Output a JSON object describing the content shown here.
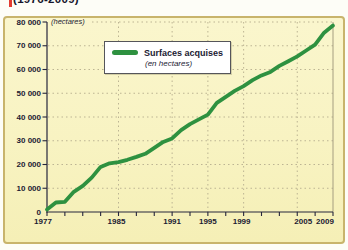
{
  "page": {
    "clipped_title": "(1976-2009)"
  },
  "legend": {
    "label": "Surfaces acquises",
    "sublabel": "(en hectares)"
  },
  "axes": {
    "y_unit_label": "(hectares)",
    "y_tick_labels": [
      "80 000",
      "70 000",
      "60 000",
      "50 000",
      "40 000",
      "30 000",
      "20 000",
      "10 000",
      "0"
    ],
    "x_tick_labels": [
      "1977",
      "1985",
      "1991",
      "1995",
      "1999",
      "2005",
      "2009"
    ]
  },
  "colors": {
    "line_green": "#2E9140",
    "panel_bg": "#F8F3C2",
    "panel_border": "#C8B46C",
    "grid": "#BCB493",
    "plot_right_frame": "#A59E80",
    "axis": "#26263C",
    "text": "#1B1B33",
    "legend_border": "#55555A",
    "red_mark": "#E23B31"
  },
  "chart_data": {
    "type": "line",
    "title": "(1976-2009)",
    "xlabel": "",
    "ylabel": "(hectares)",
    "xlim": [
      1977,
      2009
    ],
    "ylim": [
      0,
      80000
    ],
    "y_tick_step": 10000,
    "x_minor_tick_step": 2,
    "x_labeled_years": [
      1977,
      1985,
      1991,
      1995,
      1999,
      2005,
      2009
    ],
    "x_grid_years": [
      1985,
      1991,
      1995,
      1999,
      2005
    ],
    "grid": "dotted",
    "legend_position": "upper-left-inside",
    "x": [
      1977,
      1978,
      1979,
      1980,
      1981,
      1982,
      1983,
      1984,
      1985,
      1986,
      1987,
      1988,
      1989,
      1990,
      1991,
      1992,
      1993,
      1994,
      1995,
      1996,
      1997,
      1998,
      1999,
      2000,
      2001,
      2002,
      2003,
      2004,
      2005,
      2006,
      2007,
      2008,
      2009
    ],
    "series": [
      {
        "name": "Surfaces acquises",
        "values": [
          1000,
          4000,
          4300,
          8500,
          11000,
          14500,
          19000,
          20500,
          21000,
          22000,
          23200,
          24500,
          27000,
          29500,
          31000,
          34500,
          37000,
          39000,
          41000,
          46000,
          48500,
          51000,
          53000,
          55500,
          57500,
          59000,
          61500,
          63500,
          65500,
          68000,
          70500,
          75500,
          78500
        ]
      }
    ]
  }
}
